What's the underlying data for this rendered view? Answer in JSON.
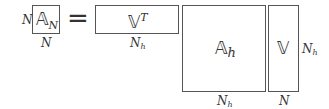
{
  "diagram": {
    "lhs": {
      "symbol": "𝔸",
      "subscript": "N",
      "row_label": "N",
      "col_label": "N"
    },
    "equals": "=",
    "factors": [
      {
        "symbol": "𝕍",
        "superscript": "T",
        "col_label": "Nh",
        "col_label_main": "N",
        "col_label_sub": "h"
      },
      {
        "symbol": "𝔸",
        "subscript": "h",
        "col_label_main": "N",
        "col_label_sub": "h"
      },
      {
        "symbol": "𝕍",
        "col_label": "N",
        "row_label_main": "N",
        "row_label_sub": "h"
      }
    ]
  }
}
